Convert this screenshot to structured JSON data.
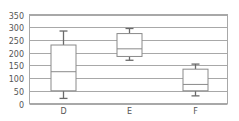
{
  "chart_data": {
    "type": "box",
    "title": "",
    "xlabel": "",
    "ylabel": "",
    "categories": [
      "D",
      "E",
      "F"
    ],
    "series": [
      {
        "name": "D",
        "whisker_low": 20,
        "q1": 50,
        "median": 125,
        "q3": 230,
        "whisker_high": 285
      },
      {
        "name": "E",
        "whisker_low": 170,
        "q1": 185,
        "median": 215,
        "q3": 275,
        "whisker_high": 295
      },
      {
        "name": "F",
        "whisker_low": 30,
        "q1": 50,
        "median": 75,
        "q3": 135,
        "whisker_high": 155
      }
    ],
    "ylim": [
      0,
      350
    ],
    "yticks": [
      0,
      50,
      100,
      150,
      200,
      250,
      300,
      350
    ],
    "grid": true,
    "legend": "none"
  }
}
